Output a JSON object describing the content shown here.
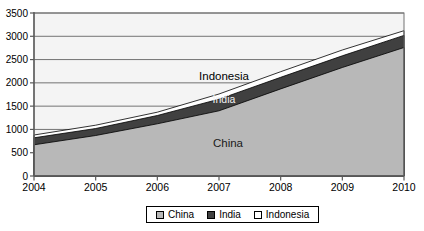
{
  "chart_data": {
    "type": "area",
    "stacked": true,
    "title": "",
    "xlabel": "",
    "ylabel": "",
    "categories": [
      "2004",
      "2005",
      "2006",
      "2007",
      "2008",
      "2009",
      "2010"
    ],
    "series": [
      {
        "name": "China",
        "color": "#b8b8b8",
        "values": [
          670,
          870,
          1120,
          1400,
          1870,
          2330,
          2760
        ]
      },
      {
        "name": "India",
        "color": "#404040",
        "values": [
          150,
          150,
          180,
          250,
          250,
          250,
          260
        ]
      },
      {
        "name": "Indonesia",
        "color": "#ffffff",
        "values": [
          60,
          70,
          70,
          110,
          120,
          125,
          100
        ]
      }
    ],
    "ylim": [
      0,
      3500
    ],
    "y_ticks": [
      0,
      500,
      1000,
      1500,
      2000,
      2500,
      3000,
      3500
    ],
    "grid": true,
    "legend_position": "bottom",
    "area_labels": [
      {
        "text": "Indonesia",
        "x": 224,
        "y": 80,
        "color": "#000000",
        "size": 11.5
      },
      {
        "text": "India",
        "x": 224,
        "y": 103,
        "color": "#f2f2f2",
        "size": 10.5
      },
      {
        "text": "China",
        "x": 228,
        "y": 147,
        "color": "#1a1a1a",
        "size": 11.5
      }
    ],
    "plot_bg_color": "#f4f4f4",
    "gridline_color": "#737373",
    "axis_color": "#595959",
    "outline_color": "#000000"
  }
}
